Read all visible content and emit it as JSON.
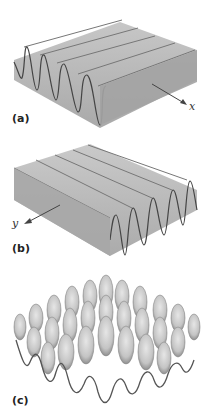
{
  "figure": {
    "panels": [
      {
        "id": "a",
        "label": "(a)",
        "description": "Sinusoidal wave surface varying along x",
        "axis_label": "x"
      },
      {
        "id": "b",
        "label": "(b)",
        "description": "Sinusoidal wave surface varying along y",
        "axis_label": "y"
      },
      {
        "id": "c",
        "label": "(c)",
        "description": "Superposition of x and y waves (egg-crate surface)"
      }
    ]
  },
  "colors": {
    "surface_fill": "#a9a9a9",
    "surface_light": "#c8c8c8",
    "ridge_line": "#555555",
    "arrow": "#444444"
  }
}
